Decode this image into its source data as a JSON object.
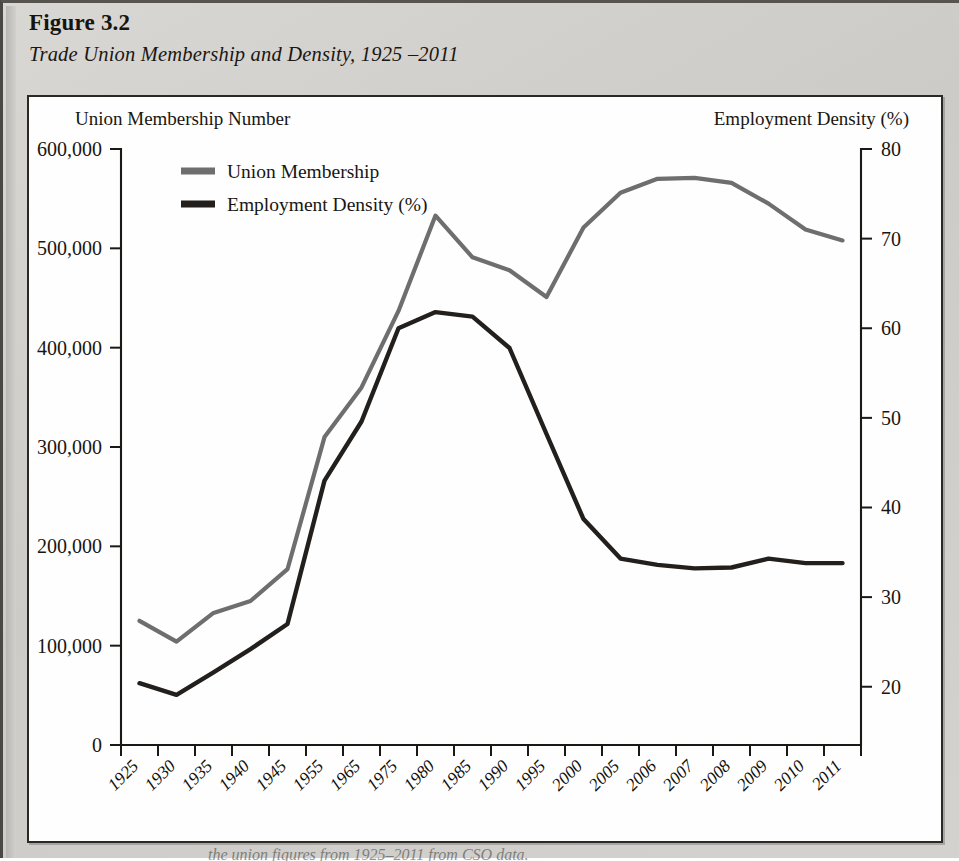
{
  "figure": {
    "number": "Figure 3.2",
    "subtitle": "Trade Union Membership and Density, 1925 –2011",
    "caption_partial": "the union figures from 1925–2011 from CSO data."
  },
  "axes": {
    "left_caption": "Union Membership Number",
    "right_caption": "Employment Density (%)",
    "x_title": "Year"
  },
  "legend": {
    "items": [
      {
        "label": "Union Membership",
        "color": "#6e6e6e"
      },
      {
        "label": "Employment Density (%)",
        "color": "#231f1c"
      }
    ]
  },
  "chart_data": {
    "type": "line",
    "title": "Trade Union Membership and Density, 1925 –2011",
    "xlabel": "Year",
    "grid": false,
    "legend_position": "top-left-inside",
    "categories": [
      "1925",
      "1930",
      "1935",
      "1940",
      "1945",
      "1955",
      "1965",
      "1975",
      "1980",
      "1985",
      "1990",
      "1995",
      "2000",
      "2005",
      "2006",
      "2007",
      "2008",
      "2009",
      "2010",
      "2011"
    ],
    "axes": {
      "left": {
        "label": "Union Membership Number",
        "ticks": [
          0,
          100000,
          200000,
          300000,
          400000,
          500000,
          600000
        ],
        "tick_labels": [
          "0",
          "100,000",
          "200,000",
          "300,000",
          "400,000",
          "500,000",
          "600,000"
        ],
        "lim": [
          0,
          600000
        ]
      },
      "right": {
        "label": "Employment Density (%)",
        "ticks": [
          20,
          30,
          40,
          50,
          60,
          70,
          80
        ],
        "tick_labels": [
          "20",
          "30",
          "40",
          "50",
          "60",
          "70",
          "80"
        ],
        "lim": [
          13.5,
          80
        ]
      }
    },
    "series": [
      {
        "name": "Union Membership",
        "axis": "left",
        "color": "#6e6e6e",
        "width": 4.2,
        "values": [
          125000,
          104000,
          133000,
          145000,
          177000,
          310000,
          360000,
          437000,
          533000,
          491000,
          478000,
          451000,
          521000,
          556000,
          570000,
          571000,
          566000,
          545000,
          519000,
          508000
        ]
      },
      {
        "name": "Employment Density (%)",
        "axis": "right",
        "color": "#231f1c",
        "width": 4.4,
        "values": [
          20.4,
          19.1,
          21.6,
          24.2,
          27.0,
          43.0,
          49.6,
          60.0,
          61.8,
          61.3,
          57.8,
          48.2,
          38.7,
          34.3,
          33.6,
          33.2,
          33.3,
          34.3,
          33.8,
          33.8
        ]
      }
    ]
  }
}
